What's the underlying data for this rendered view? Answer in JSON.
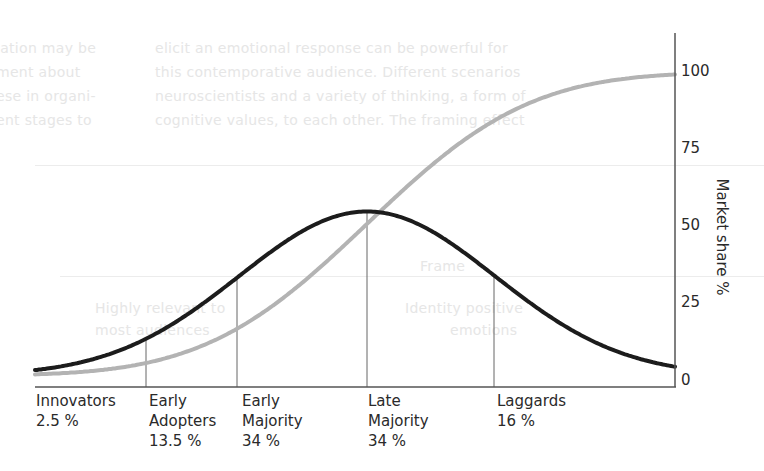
{
  "background_ghost_text": {
    "left_column": [
      "lation may be",
      "ment about",
      "ese in organi-",
      "ent stages to"
    ],
    "middle_column": [
      "elicit an emotional response can be powerful for",
      "this contemporative audience. Different scenarios",
      "neuroscientists and a variety of thinking, a form of",
      "cognitive values, to each other. The framing effect"
    ],
    "lower": [
      "Frame",
      "Highly relevant to",
      "Identity positive",
      "most audiences",
      "emotions"
    ]
  },
  "chart_data": {
    "type": "line",
    "title": "",
    "xlabel": "",
    "ylabel": "Market share %",
    "ylim": [
      0,
      100
    ],
    "yticks": [
      0,
      25,
      50,
      75,
      100
    ],
    "y_axis_position": "right",
    "grid": false,
    "legend": null,
    "categories": [
      {
        "name": "Innovators",
        "share": "2.5 %",
        "label_lines": [
          "Innovators",
          "2.5 %"
        ]
      },
      {
        "name": "Early Adopters",
        "share": "13.5 %",
        "label_lines": [
          "Early",
          "Adopters",
          "13.5 %"
        ]
      },
      {
        "name": "Early Majority",
        "share": "34 %",
        "label_lines": [
          "Early",
          "Majority",
          "34 %"
        ]
      },
      {
        "name": "Late Majority",
        "share": "34 %",
        "label_lines": [
          "Late",
          "Majority",
          "34 %"
        ]
      },
      {
        "name": "Laggards",
        "share": "16 %",
        "label_lines": [
          "Laggards",
          "16 %"
        ]
      }
    ],
    "series": [
      {
        "name": "Adoption (bell curve)",
        "kind": "normal_pdf",
        "color": "#1c1c1c",
        "peak_value": 55,
        "description": "Diffusion of innovations adopter distribution"
      },
      {
        "name": "Market share (cumulative)",
        "kind": "normal_cdf",
        "color": "#b3b3b3",
        "min_value": 2,
        "max_value": 100
      }
    ],
    "dividers_sigma": [
      -2,
      -1,
      0,
      1
    ],
    "annotations": []
  },
  "labels": {
    "cat0": "Innovators\n2.5 %",
    "cat1": "Early\nAdopters\n13.5 %",
    "cat2": "Early\nMajority\n34 %",
    "cat3": "Late\nMajority\n34 %",
    "cat4": "Laggards\n16 %",
    "tick0": "0",
    "tick25": "25",
    "tick50": "50",
    "tick75": "75",
    "tick100": "100",
    "ylabel": "Market share %"
  },
  "colors": {
    "bell": "#1c1c1c",
    "cumulative": "#b3b3b3",
    "axis": "#555555",
    "divider": "#666666"
  }
}
